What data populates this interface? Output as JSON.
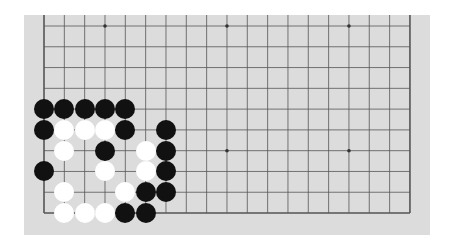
{
  "board": {
    "background": "#dcdcdc",
    "line_color": "#555555",
    "columns": 19,
    "rows": 10,
    "origin": {
      "x": 44,
      "y": 26
    },
    "spacing": {
      "x": 20.33,
      "y": 20.78
    },
    "top_edge_open": true,
    "star_points": [
      {
        "col": 3,
        "row": 0
      },
      {
        "col": 9,
        "row": 0
      },
      {
        "col": 15,
        "row": 0
      },
      {
        "col": 9,
        "row": 6
      },
      {
        "col": 15,
        "row": 6
      }
    ]
  },
  "stones": [
    {
      "color": "black",
      "col": 0,
      "row": 4
    },
    {
      "color": "black",
      "col": 1,
      "row": 4
    },
    {
      "color": "black",
      "col": 2,
      "row": 4
    },
    {
      "color": "black",
      "col": 3,
      "row": 4
    },
    {
      "color": "black",
      "col": 4,
      "row": 4
    },
    {
      "color": "black",
      "col": 0,
      "row": 5
    },
    {
      "color": "white",
      "col": 1,
      "row": 5
    },
    {
      "color": "white",
      "col": 2,
      "row": 5
    },
    {
      "color": "white",
      "col": 3,
      "row": 5
    },
    {
      "color": "black",
      "col": 4,
      "row": 5
    },
    {
      "color": "black",
      "col": 6,
      "row": 5
    },
    {
      "color": "white",
      "col": 1,
      "row": 6
    },
    {
      "color": "black",
      "col": 3,
      "row": 6
    },
    {
      "color": "white",
      "col": 5,
      "row": 6
    },
    {
      "color": "black",
      "col": 6,
      "row": 6
    },
    {
      "color": "black",
      "col": 0,
      "row": 7
    },
    {
      "color": "white",
      "col": 3,
      "row": 7
    },
    {
      "color": "white",
      "col": 5,
      "row": 7
    },
    {
      "color": "black",
      "col": 6,
      "row": 7
    },
    {
      "color": "white",
      "col": 1,
      "row": 8
    },
    {
      "color": "white",
      "col": 4,
      "row": 8
    },
    {
      "color": "black",
      "col": 5,
      "row": 8
    },
    {
      "color": "black",
      "col": 6,
      "row": 8
    },
    {
      "color": "white",
      "col": 1,
      "row": 9
    },
    {
      "color": "white",
      "col": 2,
      "row": 9
    },
    {
      "color": "white",
      "col": 3,
      "row": 9
    },
    {
      "color": "black",
      "col": 4,
      "row": 9
    },
    {
      "color": "black",
      "col": 5,
      "row": 9
    }
  ]
}
